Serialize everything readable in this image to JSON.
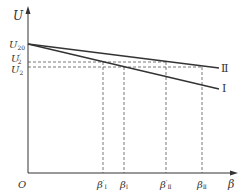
{
  "diagram": {
    "axes": {
      "y_label": "U",
      "x_label": "β",
      "origin_label": "O"
    },
    "y_ticks": [
      {
        "id": "U20",
        "base": "U",
        "sub": "20",
        "prime": "",
        "y": 44
      },
      {
        "id": "U2p",
        "base": "U",
        "sub": "2",
        "prime": "′",
        "y": 62
      },
      {
        "id": "U2",
        "base": "U",
        "sub": "2",
        "prime": "",
        "y": 67
      }
    ],
    "x_ticks": [
      {
        "id": "betaIp",
        "base": "β",
        "sub": "Ⅰ",
        "prime": "′",
        "x": 103
      },
      {
        "id": "betaI",
        "base": "β",
        "sub": "Ⅰ",
        "prime": "",
        "x": 124
      },
      {
        "id": "betaIIp",
        "base": "β",
        "sub": "Ⅱ",
        "prime": "′",
        "x": 166
      },
      {
        "id": "betaII",
        "base": "β",
        "sub": "Ⅱ",
        "prime": "",
        "x": 202
      }
    ],
    "lines": [
      {
        "id": "line-I",
        "label": "Ⅰ",
        "x1": 28,
        "y1": 44,
        "x2": 219,
        "y2": 89
      },
      {
        "id": "line-II",
        "label": "Ⅱ",
        "x1": 28,
        "y1": 44,
        "x2": 219,
        "y2": 68
      }
    ],
    "colors": {
      "line": "#333333",
      "dash": "#555555"
    }
  }
}
